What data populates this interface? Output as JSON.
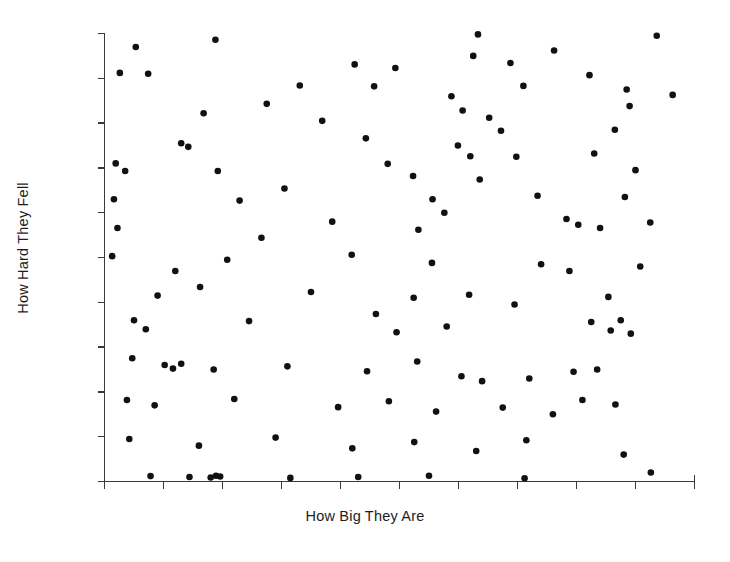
{
  "chart_data": {
    "type": "scatter",
    "title": "",
    "xlabel": "How Big They Are",
    "ylabel": "How Hard They Fell",
    "xlim": [
      0,
      100
    ],
    "ylim": [
      0,
      100
    ],
    "grid": false,
    "legend": null,
    "marker": {
      "shape": "circle",
      "color": "#111111",
      "size": 3.3
    },
    "axis_color": "#3a3a3a",
    "x_ticks": [
      0,
      10,
      20,
      30,
      40,
      50,
      60,
      70,
      80,
      90,
      100
    ],
    "x_tick_labels": [
      "",
      "",
      "",
      "",
      "",
      "",
      "",
      "",
      "",
      "",
      ""
    ],
    "y_ticks": [
      0,
      10,
      20,
      30,
      40,
      50,
      60,
      70,
      80,
      90,
      100
    ],
    "y_tick_labels": [
      "",
      "",
      "",
      "",
      "",
      "",
      "",
      "",
      "",
      "",
      ""
    ],
    "n_points": 120,
    "points": [
      [
        5.3,
        97.0
      ],
      [
        18.8,
        98.6
      ],
      [
        63.3,
        99.8
      ],
      [
        93.6,
        99.5
      ],
      [
        2.6,
        91.2
      ],
      [
        7.4,
        91.0
      ],
      [
        42.4,
        93.1
      ],
      [
        49.3,
        92.3
      ],
      [
        62.5,
        95.0
      ],
      [
        68.8,
        93.4
      ],
      [
        76.2,
        96.2
      ],
      [
        82.2,
        90.7
      ],
      [
        33.1,
        88.4
      ],
      [
        45.7,
        88.2
      ],
      [
        58.8,
        86.0
      ],
      [
        71.0,
        88.3
      ],
      [
        88.5,
        87.5
      ],
      [
        96.3,
        86.3
      ],
      [
        89.0,
        83.8
      ],
      [
        16.8,
        82.2
      ],
      [
        27.5,
        84.3
      ],
      [
        36.9,
        80.5
      ],
      [
        60.7,
        82.8
      ],
      [
        65.2,
        81.2
      ],
      [
        67.2,
        78.3
      ],
      [
        86.5,
        78.5
      ],
      [
        13.0,
        75.5
      ],
      [
        14.2,
        74.7
      ],
      [
        44.3,
        76.6
      ],
      [
        59.9,
        75.0
      ],
      [
        62.0,
        72.6
      ],
      [
        69.8,
        72.5
      ],
      [
        83.0,
        73.2
      ],
      [
        1.9,
        71.0
      ],
      [
        3.5,
        69.3
      ],
      [
        19.2,
        69.3
      ],
      [
        48.0,
        70.9
      ],
      [
        52.3,
        68.2
      ],
      [
        63.6,
        67.4
      ],
      [
        90.0,
        69.5
      ],
      [
        1.6,
        63.0
      ],
      [
        22.9,
        62.7
      ],
      [
        30.5,
        65.4
      ],
      [
        55.6,
        63.0
      ],
      [
        57.6,
        60.0
      ],
      [
        73.4,
        63.8
      ],
      [
        88.2,
        63.5
      ],
      [
        2.2,
        56.6
      ],
      [
        26.6,
        54.4
      ],
      [
        38.6,
        58.0
      ],
      [
        53.2,
        56.2
      ],
      [
        78.3,
        58.6
      ],
      [
        80.3,
        57.3
      ],
      [
        84.0,
        56.6
      ],
      [
        92.5,
        57.8
      ],
      [
        1.3,
        50.3
      ],
      [
        12.0,
        47.0
      ],
      [
        20.8,
        49.5
      ],
      [
        41.9,
        50.6
      ],
      [
        55.5,
        48.8
      ],
      [
        74.0,
        48.5
      ],
      [
        78.8,
        47.0
      ],
      [
        90.8,
        48.0
      ],
      [
        9.0,
        41.5
      ],
      [
        16.2,
        43.4
      ],
      [
        35.0,
        42.3
      ],
      [
        52.4,
        41.0
      ],
      [
        61.8,
        41.7
      ],
      [
        69.5,
        39.5
      ],
      [
        85.4,
        41.2
      ],
      [
        5.0,
        36.0
      ],
      [
        7.0,
        34.0
      ],
      [
        24.5,
        35.8
      ],
      [
        46.0,
        37.4
      ],
      [
        49.5,
        33.3
      ],
      [
        58.0,
        34.6
      ],
      [
        82.5,
        35.6
      ],
      [
        85.8,
        33.7
      ],
      [
        87.5,
        36.0
      ],
      [
        89.2,
        33.0
      ],
      [
        4.7,
        27.5
      ],
      [
        10.2,
        26.0
      ],
      [
        11.6,
        25.2
      ],
      [
        13.0,
        26.3
      ],
      [
        18.5,
        25.0
      ],
      [
        31.0,
        25.7
      ],
      [
        44.5,
        24.6
      ],
      [
        53.0,
        26.8
      ],
      [
        60.5,
        23.5
      ],
      [
        64.0,
        22.4
      ],
      [
        72.0,
        23.0
      ],
      [
        79.5,
        24.5
      ],
      [
        83.5,
        25.0
      ],
      [
        3.8,
        18.2
      ],
      [
        8.5,
        17.0
      ],
      [
        22.0,
        18.4
      ],
      [
        39.6,
        16.6
      ],
      [
        48.2,
        17.9
      ],
      [
        56.2,
        15.6
      ],
      [
        67.5,
        16.5
      ],
      [
        76.0,
        15.0
      ],
      [
        81.0,
        18.2
      ],
      [
        86.6,
        17.2
      ],
      [
        4.2,
        9.5
      ],
      [
        16.0,
        8.0
      ],
      [
        29.0,
        9.8
      ],
      [
        42.0,
        7.4
      ],
      [
        52.5,
        8.8
      ],
      [
        63.0,
        6.8
      ],
      [
        71.5,
        9.2
      ],
      [
        88.0,
        6.0
      ],
      [
        7.8,
        1.2
      ],
      [
        14.4,
        1.0
      ],
      [
        18.0,
        0.9
      ],
      [
        18.9,
        1.3
      ],
      [
        19.6,
        1.1
      ],
      [
        31.5,
        0.8
      ],
      [
        43.0,
        1.0
      ],
      [
        55.0,
        1.3
      ],
      [
        71.2,
        0.7
      ],
      [
        92.6,
        2.0
      ]
    ]
  },
  "axes": {
    "x_label": "How Big They Are",
    "y_label": "How Hard They Fell"
  }
}
